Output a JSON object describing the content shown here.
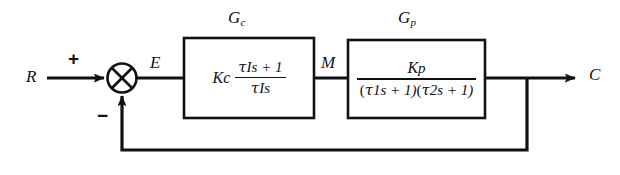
{
  "diagram": {
    "type": "feedback-control-block-diagram",
    "background_color": "#ffffff",
    "line_color": "#111111",
    "signals": {
      "reference": "R",
      "error": "E",
      "manipulated": "M",
      "controlled": "C"
    },
    "summing_junction": {
      "name": "comparator",
      "glyph": "circle-with-x",
      "inputs": [
        {
          "signal": "R",
          "sign": "+",
          "direction": "from-left"
        },
        {
          "signal": "C",
          "sign": "−",
          "direction": "from-below"
        }
      ],
      "output": "E",
      "plus_label": "+",
      "minus_label": "−"
    },
    "blocks": [
      {
        "id": "controller",
        "label": "G",
        "label_sub": "c",
        "role": "PI controller",
        "transfer_function": {
          "gain": "K",
          "gain_sub": "c",
          "numerator": "τ₁s + 1",
          "denominator": "τ₁s",
          "num_tau": "τ",
          "num_tau_sub": "I",
          "num_rest": "s + 1",
          "den_tau": "τ",
          "den_tau_sub": "I",
          "den_rest": "s"
        },
        "input_signal": "E",
        "output_signal": "M"
      },
      {
        "id": "process",
        "label": "G",
        "label_sub": "p",
        "role": "second-order process",
        "transfer_function": {
          "numerator_gain": "K",
          "numerator_gain_sub": "p",
          "denominator_factor_1_open": "(",
          "denominator_factor_1_tau": "τ",
          "denominator_factor_1_sub": "1",
          "denominator_factor_1_rest": "s + 1)",
          "denominator_factor_2_open": "(",
          "denominator_factor_2_tau": "τ",
          "denominator_factor_2_sub": "2",
          "denominator_factor_2_rest": "s + 1)"
        },
        "input_signal": "M",
        "output_signal": "C"
      }
    ],
    "feedback_path": {
      "name": "unity-feedback",
      "description": "Output C tapped and fed back to the negative input of the summing junction",
      "gain": "1"
    }
  }
}
